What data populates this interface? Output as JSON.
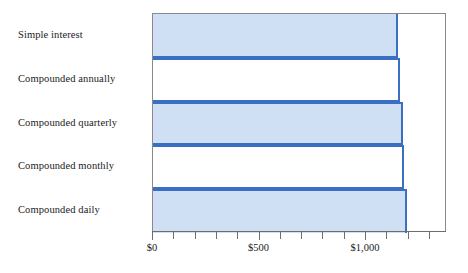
{
  "chart_data": {
    "type": "bar",
    "orientation": "horizontal",
    "title": "",
    "xlabel": "",
    "ylabel": "",
    "categories": [
      "Simple interest",
      "Compounded annually",
      "Compounded quarterly",
      "Compounded monthly",
      "Compounded daily"
    ],
    "values": [
      1150,
      1161,
      1172,
      1180,
      1191
    ],
    "value_prefix": "$",
    "xlim": [
      0,
      1380
    ],
    "xticks": [
      0,
      100,
      200,
      300,
      400,
      500,
      600,
      700,
      800,
      900,
      1000,
      1100,
      1200,
      1300
    ],
    "xtick_labels": [
      "$0",
      "",
      "",
      "",
      "",
      "$500",
      "",
      "",
      "",
      "",
      "$1,000",
      "",
      "",
      ""
    ],
    "labeled_ticks": [
      {
        "value": 0,
        "label": "$0"
      },
      {
        "value": 500,
        "label": "$500"
      },
      {
        "value": 1000,
        "label": "$1,000"
      }
    ],
    "grid": false,
    "legend": null,
    "series_fill_color": "#cfdff4",
    "series_edge_color": "#3a6fc4",
    "axis_color": "#6e6e6e",
    "frame_color": "#8a8a8a",
    "bar_styles": [
      "filled",
      "empty",
      "filled",
      "empty",
      "filled"
    ]
  }
}
